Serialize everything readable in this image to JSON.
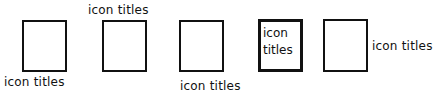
{
  "diagram": {
    "items": [
      {
        "label": "icon titles",
        "position": "below"
      },
      {
        "label": "icon titles",
        "position": "above"
      },
      {
        "label": "icon titles",
        "position": "below-offset"
      },
      {
        "label_line1": "icon",
        "label_line2": "titles",
        "position": "inside"
      },
      {
        "label": "icon titles",
        "position": "right"
      }
    ]
  }
}
